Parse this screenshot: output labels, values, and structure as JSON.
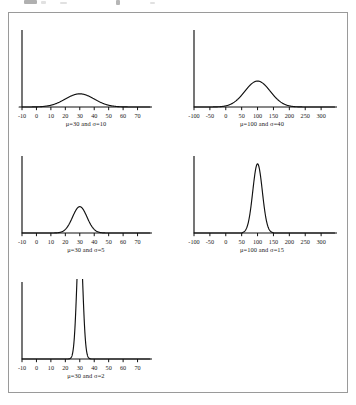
{
  "figure": {
    "background_color": "#ffffff",
    "frame_color": "#9a9a9a",
    "ink_color": "#111111"
  },
  "chart_data": [
    {
      "type": "line",
      "title": "",
      "caption": "μ=30 and σ=10",
      "mu": 30,
      "sigma": 10,
      "xlabel": "",
      "ylabel": "",
      "xlim": [
        -10,
        70
      ],
      "ticks": [
        -10,
        0,
        10,
        20,
        30,
        40,
        50,
        60,
        70
      ],
      "tick_labels": [
        "-10",
        "0",
        "10",
        "20",
        "30",
        "40",
        "50",
        "60",
        "70"
      ],
      "grid": false,
      "legend": "none",
      "peak_density": 0.0399,
      "peak_x": 30,
      "visible_support": [
        -12,
        72
      ]
    },
    {
      "type": "line",
      "title": "",
      "caption": "μ=100 and σ=40",
      "mu": 100,
      "sigma": 40,
      "xlabel": "",
      "ylabel": "",
      "xlim": [
        -100,
        300
      ],
      "ticks": [
        -100,
        -50,
        0,
        50,
        100,
        150,
        200,
        250,
        300
      ],
      "tick_labels": [
        "-100",
        "-50",
        "0",
        "50",
        "100",
        "150",
        "200",
        "250",
        "300"
      ],
      "grid": false,
      "legend": "none",
      "peak_density": 0.00997,
      "peak_x": 100,
      "visible_support": [
        -40,
        240
      ]
    },
    {
      "type": "line",
      "title": "",
      "caption": "μ=30 and σ=5",
      "mu": 30,
      "sigma": 5,
      "xlabel": "",
      "ylabel": "",
      "xlim": [
        -10,
        70
      ],
      "ticks": [
        -10,
        0,
        10,
        20,
        30,
        40,
        50,
        60,
        70
      ],
      "tick_labels": [
        "-10",
        "0",
        "10",
        "20",
        "30",
        "40",
        "50",
        "60",
        "70"
      ],
      "grid": false,
      "legend": "none",
      "peak_density": 0.0798,
      "peak_x": 30,
      "visible_support": [
        10,
        50
      ]
    },
    {
      "type": "line",
      "title": "",
      "caption": "μ=100 and σ=15",
      "mu": 100,
      "sigma": 15,
      "xlabel": "",
      "ylabel": "",
      "xlim": [
        -100,
        300
      ],
      "ticks": [
        -100,
        -50,
        0,
        50,
        100,
        150,
        200,
        250,
        300
      ],
      "tick_labels": [
        "-100",
        "-50",
        "0",
        "50",
        "100",
        "150",
        "200",
        "250",
        "300"
      ],
      "grid": false,
      "legend": "none",
      "peak_density": 0.0266,
      "peak_x": 100,
      "visible_support": [
        52,
        150
      ]
    },
    {
      "type": "line",
      "title": "",
      "caption": "μ=30 and σ=2",
      "mu": 30,
      "sigma": 2,
      "xlabel": "",
      "ylabel": "",
      "xlim": [
        -10,
        70
      ],
      "ticks": [
        -10,
        0,
        10,
        20,
        30,
        40,
        50,
        60,
        70
      ],
      "tick_labels": [
        "-10",
        "0",
        "10",
        "20",
        "30",
        "40",
        "50",
        "60",
        "70"
      ],
      "grid": false,
      "legend": "none",
      "peak_density": 0.1995,
      "peak_x": 30,
      "visible_support": [
        22,
        38
      ]
    }
  ]
}
